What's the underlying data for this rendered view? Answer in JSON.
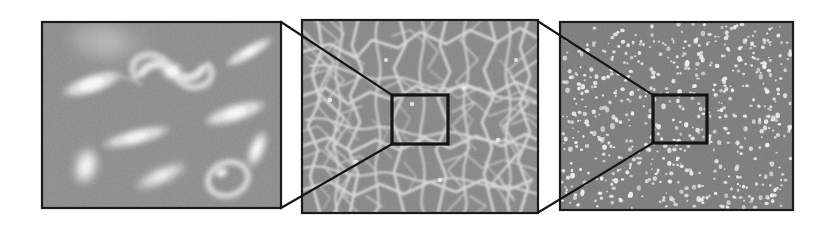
{
  "figure": {
    "caption": "",
    "background_color": "#ffffff",
    "width": 840,
    "height": 225,
    "panel_count": 3,
    "zoom_direction": "left-to-right successive magnification"
  },
  "colors": {
    "frame_stroke": "#1a1a1a",
    "connector_stroke": "#141414",
    "inset_stroke": "#141414",
    "panel1_background": "#8b8b8b",
    "panel2_background": "#858585",
    "panel3_background": "#7b7b7b",
    "feature_bright": "#f2f2f2",
    "feature_mid": "#d8d8d8",
    "page_background": "#ffffff"
  },
  "panels": [
    {
      "id": "panel-galaxies",
      "name": "galaxy-field-panel",
      "index": 1,
      "content_label": "galaxies",
      "description": "Grayscale field of resolved galaxies: spirals, edge-on disks, ellipticals and a ring galaxy on a noisy gray sky background",
      "rect": {
        "x": 42,
        "y": 22,
        "w": 239,
        "h": 186
      },
      "has_inset_box": false,
      "objects": [
        {
          "name": "spiral-galaxy-central",
          "type": "spiral",
          "cx": 170,
          "cy": 70,
          "size": 34,
          "angle": 25,
          "brightness": 1.0
        },
        {
          "name": "edge-on-galaxy-upper-left",
          "type": "edge-on",
          "cx": 92,
          "cy": 84,
          "rx": 30,
          "ry": 10,
          "angle": -18,
          "brightness": 0.95
        },
        {
          "name": "edge-on-galaxy-upper-right",
          "type": "edge-on",
          "cx": 248,
          "cy": 52,
          "rx": 24,
          "ry": 7,
          "angle": -30,
          "brightness": 0.9
        },
        {
          "name": "edge-on-galaxy-mid-right",
          "type": "edge-on",
          "cx": 235,
          "cy": 112,
          "rx": 30,
          "ry": 9,
          "angle": -18,
          "brightness": 0.95
        },
        {
          "name": "edge-on-galaxy-mid-left",
          "type": "edge-on",
          "cx": 134,
          "cy": 136,
          "rx": 33,
          "ry": 9,
          "angle": -15,
          "brightness": 0.9
        },
        {
          "name": "elliptical-galaxy-lower-left",
          "type": "elliptical",
          "cx": 85,
          "cy": 165,
          "rx": 11,
          "ry": 17,
          "angle": 15,
          "brightness": 0.85
        },
        {
          "name": "edge-on-galaxy-lower-center",
          "type": "edge-on",
          "cx": 160,
          "cy": 175,
          "rx": 26,
          "ry": 8,
          "angle": -25,
          "brightness": 0.85
        },
        {
          "name": "elliptical-galaxy-right-edge",
          "type": "elliptical",
          "cx": 256,
          "cy": 148,
          "rx": 8,
          "ry": 17,
          "angle": 20,
          "brightness": 0.9
        },
        {
          "name": "ring-galaxy-lower-right",
          "type": "ring",
          "cx": 227,
          "cy": 178,
          "rx": 21,
          "ry": 17,
          "angle": -20,
          "brightness": 0.85
        },
        {
          "name": "diffuse-halo-upper-left",
          "type": "diffuse",
          "cx": 110,
          "cy": 42,
          "rx": 42,
          "ry": 22,
          "angle": 0,
          "brightness": 0.35
        }
      ]
    },
    {
      "id": "panel-filaments",
      "name": "cosmic-web-panel",
      "index": 2,
      "content_label": "cosmic web filaments",
      "description": "Network of bright filamentary strands forming a cosmic-web / voronoi-like pattern on gray background",
      "rect": {
        "x": 302,
        "y": 20,
        "w": 236,
        "h": 193
      },
      "has_inset_box": true,
      "inset_box": {
        "x": 392,
        "y": 95,
        "w": 56,
        "h": 49
      },
      "connectors_from_previous": [
        {
          "from": [
            281,
            22
          ],
          "to": [
            392,
            95
          ]
        },
        {
          "from": [
            281,
            208
          ],
          "to": [
            392,
            144
          ]
        }
      ],
      "node_count": 46,
      "filament_count": 96
    },
    {
      "id": "panel-points",
      "name": "point-distribution-panel",
      "index": 3,
      "content_label": "point sources",
      "description": "Dense field of small bright point sources (unresolved clumps) uniformly scattered on gray background",
      "rect": {
        "x": 560,
        "y": 22,
        "w": 233,
        "h": 188
      },
      "has_inset_box": true,
      "inset_box": {
        "x": 653,
        "y": 95,
        "w": 54,
        "h": 48
      },
      "connectors_from_previous": [
        {
          "from": [
            539,
            22
          ],
          "to": [
            653,
            95
          ]
        },
        {
          "from": [
            539,
            212
          ],
          "to": [
            653,
            143
          ]
        }
      ],
      "point_count": 620
    }
  ]
}
